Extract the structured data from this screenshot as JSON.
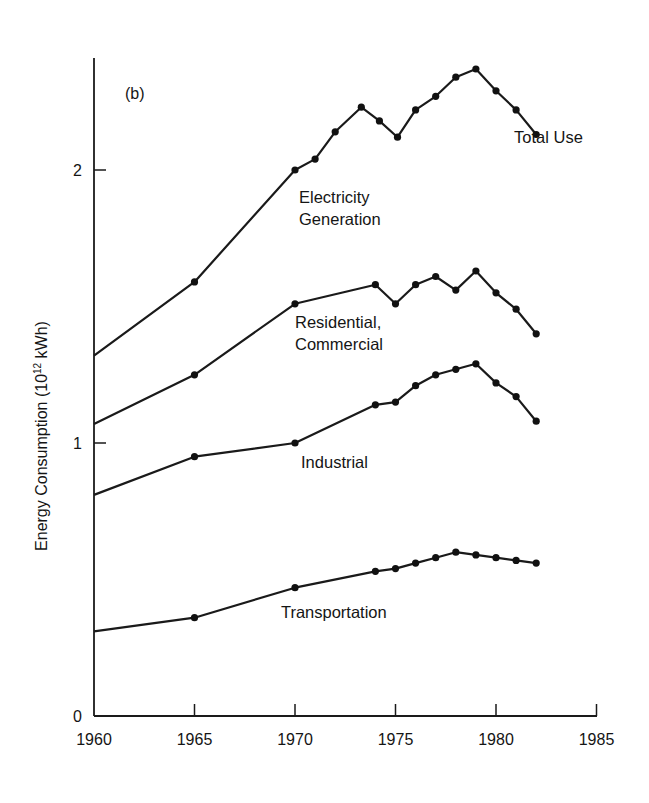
{
  "chart_data": {
    "type": "line",
    "panel_label": "(b)",
    "title": "",
    "xlabel": "",
    "ylabel": "Energy Consumption (10^12 kWh)",
    "ylabel_parts": {
      "main": "Energy Consumption (10",
      "sup": "12",
      "tail": " kWh)"
    },
    "xlim": [
      1960,
      1985
    ],
    "ylim": [
      0,
      2.4
    ],
    "x_ticks": [
      1960,
      1965,
      1970,
      1975,
      1980,
      1985
    ],
    "x_tick_labels": [
      "1960",
      "1965",
      "1970",
      "1975",
      "1980",
      "1985"
    ],
    "y_ticks": [
      0,
      1,
      2
    ],
    "y_tick_labels": [
      "0",
      "1",
      "2"
    ],
    "grid": false,
    "legend": "inline labels",
    "series": [
      {
        "name": "Total Use",
        "label_lines": [
          "Total Use"
        ],
        "x": [
          1960,
          1965,
          1970,
          1971,
          1972,
          1973.3,
          1974.2,
          1975.1,
          1976,
          1977,
          1978,
          1979,
          1980,
          1981,
          1982
        ],
        "values": [
          1.32,
          1.59,
          2.0,
          2.04,
          2.14,
          2.23,
          2.18,
          2.12,
          2.22,
          2.27,
          2.34,
          2.37,
          2.29,
          2.22,
          2.13
        ],
        "markers_from_index": 1
      },
      {
        "name": "Residential, Commercial",
        "label_lines": [
          "Residential,",
          "Commercial"
        ],
        "x": [
          1960,
          1965,
          1970,
          1974,
          1975,
          1976,
          1977,
          1978,
          1979,
          1980,
          1981,
          1982
        ],
        "values": [
          1.07,
          1.25,
          1.51,
          1.58,
          1.51,
          1.58,
          1.61,
          1.56,
          1.63,
          1.55,
          1.49,
          1.4
        ],
        "markers_from_index": 1
      },
      {
        "name": "Industrial",
        "label_lines": [
          "Industrial"
        ],
        "x": [
          1960,
          1965,
          1970,
          1974,
          1975,
          1976,
          1977,
          1978,
          1979,
          1980,
          1981,
          1982
        ],
        "values": [
          0.81,
          0.95,
          1.0,
          1.14,
          1.15,
          1.21,
          1.25,
          1.27,
          1.29,
          1.22,
          1.17,
          1.08
        ],
        "markers_from_index": 1
      },
      {
        "name": "Transportation",
        "label_lines": [
          "Transportation"
        ],
        "x": [
          1960,
          1965,
          1970,
          1974,
          1975,
          1976,
          1977,
          1978,
          1979,
          1980,
          1981,
          1982
        ],
        "values": [
          0.31,
          0.36,
          0.47,
          0.53,
          0.54,
          0.56,
          0.58,
          0.6,
          0.59,
          0.58,
          0.57,
          0.56
        ],
        "markers_from_index": 1
      }
    ],
    "annotations": [
      {
        "text_lines": [
          "Electricity",
          "Generation"
        ],
        "x": 1970.2,
        "y": 1.88,
        "note": "label for region between Total Use and Residential, Commercial"
      },
      {
        "text_lines": [
          "Residential,",
          "Commercial"
        ],
        "x": 1970,
        "y": 1.42
      },
      {
        "text_lines": [
          "Industrial"
        ],
        "x": 1970.3,
        "y": 0.91
      },
      {
        "text_lines": [
          "Transportation"
        ],
        "x": 1969.3,
        "y": 0.36
      },
      {
        "text_lines": [
          "Total Use"
        ],
        "x": 1980.9,
        "y": 2.1
      }
    ]
  },
  "layout": {
    "x0_px": 94,
    "px_per_year": 20.1,
    "y0_px": 716,
    "px_per_unit": 273,
    "axis_top_px": 58,
    "axis_right_px": 597
  }
}
